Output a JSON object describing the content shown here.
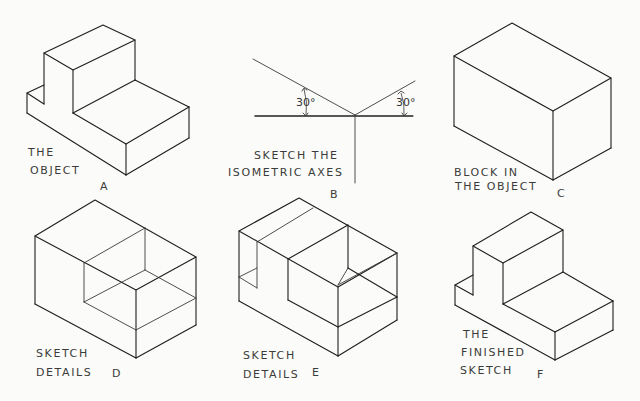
{
  "figures": {
    "A": {
      "letter": "A",
      "caption": [
        "THE",
        "OBJECT"
      ]
    },
    "B": {
      "letter": "B",
      "caption": [
        "SKETCH THE",
        "ISOMETRIC AXES"
      ],
      "angle_left": "30°",
      "angle_right": "30°"
    },
    "C": {
      "letter": "C",
      "caption": [
        "BLOCK IN",
        "THE OBJECT"
      ]
    },
    "D": {
      "letter": "D",
      "caption": [
        "SKETCH",
        "DETAILS"
      ]
    },
    "E": {
      "letter": "E",
      "caption": [
        "SKETCH",
        "DETAILS"
      ]
    },
    "F": {
      "letter": "F",
      "caption": [
        "THE",
        "FINISHED",
        "SKETCH"
      ]
    }
  },
  "colors": {
    "background": "#fbfbf9",
    "line": "#1e1e1e",
    "text": "#3b3b3b"
  }
}
